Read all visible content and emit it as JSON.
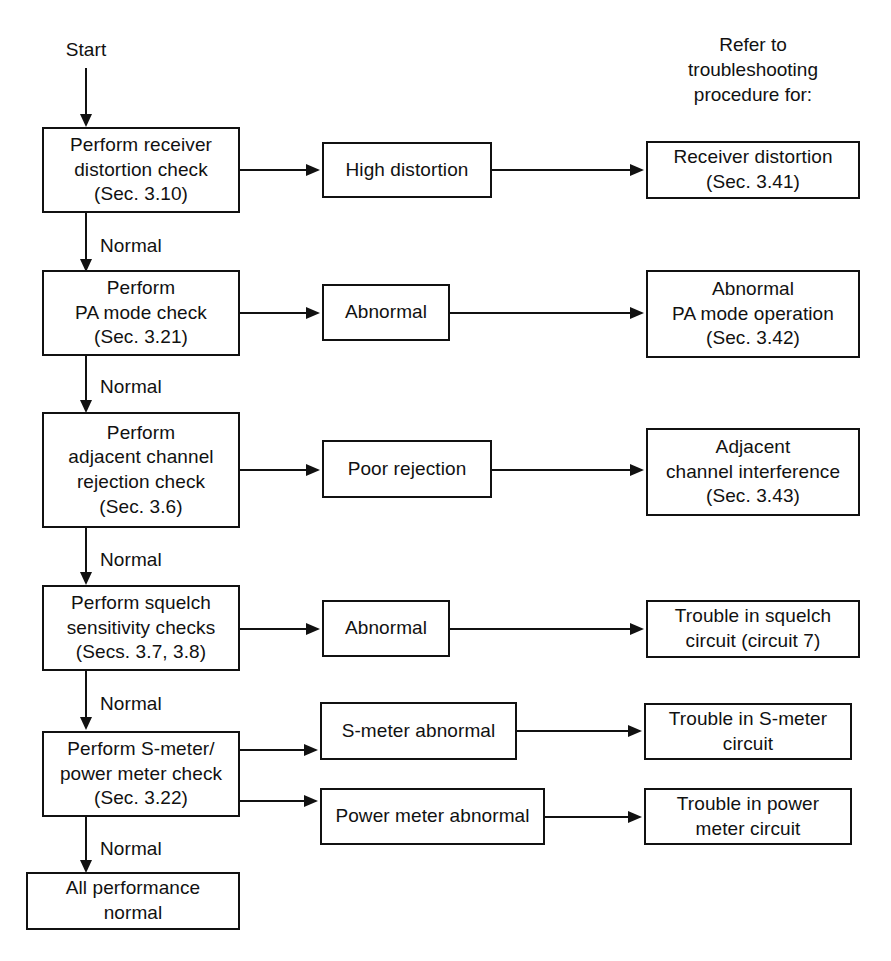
{
  "diagram": {
    "start_label": "Start",
    "branch_label": "Normal",
    "column_header": "Refer to\ntroubleshooting\nprocedure for:",
    "line_color": "#111111",
    "background_color": "#ffffff"
  },
  "steps": [
    {
      "id": "receiver-distortion-check",
      "check": "Perform receiver\ndistortion check\n(Sec. 3.10)",
      "pass_label": "Normal",
      "fail": "High distortion",
      "procedure": "Receiver distortion\n(Sec. 3.41)"
    },
    {
      "id": "pa-mode-check",
      "check": "Perform\nPA mode check\n(Sec. 3.21)",
      "pass_label": "Normal",
      "fail": "Abnormal",
      "procedure": "Abnormal\nPA mode operation\n(Sec. 3.42)"
    },
    {
      "id": "adjacent-channel-rejection-check",
      "check": "Perform\nadjacent channel\nrejection check\n(Sec. 3.6)",
      "pass_label": "Normal",
      "fail": "Poor rejection",
      "procedure": "Adjacent\nchannel interference\n(Sec. 3.43)"
    },
    {
      "id": "squelch-sensitivity-checks",
      "check": "Perform squelch\nsensitivity checks\n(Secs. 3.7, 3.8)",
      "pass_label": "Normal",
      "fail": "Abnormal",
      "procedure": "Trouble in squelch\ncircuit (circuit 7)"
    },
    {
      "id": "s-meter-power-meter-check",
      "check": "Perform S-meter/\npower meter check\n(Sec. 3.22)",
      "pass_label": "Normal",
      "fail": "S-meter abnormal",
      "procedure": "Trouble in S-meter\ncircuit",
      "fail2": "Power meter abnormal",
      "procedure2": "Trouble in power\nmeter circuit"
    }
  ],
  "terminal": {
    "id": "all-performance-normal",
    "label": "All performance\nnormal"
  }
}
